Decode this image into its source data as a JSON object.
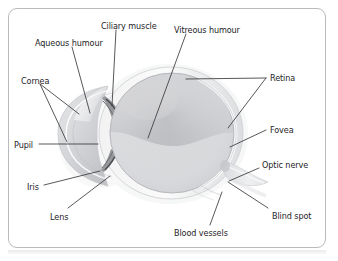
{
  "figure": {
    "frame_border_color": "#b9babc",
    "background_color": "#ffffff",
    "label_text_color": "#1d1d1f",
    "leader_line_color": "#3a3a3c"
  },
  "labels": [
    {
      "id": "ciliary-muscle",
      "text": "Ciliary muscle",
      "x": 101,
      "y": 22
    },
    {
      "id": "vitreous-humour",
      "text": "Vitreous humour",
      "x": 174,
      "y": 26
    },
    {
      "id": "aqueous-humour",
      "text": "Aqueous humour",
      "x": 35,
      "y": 39
    },
    {
      "id": "cornea",
      "text": "Cornea",
      "x": 21,
      "y": 77
    },
    {
      "id": "retina",
      "text": "Retina",
      "x": 270,
      "y": 74
    },
    {
      "id": "fovea",
      "text": "Fovea",
      "x": 270,
      "y": 126
    },
    {
      "id": "pupil",
      "text": "Pupil",
      "x": 14,
      "y": 141
    },
    {
      "id": "optic-nerve",
      "text": "Optic nerve",
      "x": 262,
      "y": 161
    },
    {
      "id": "iris",
      "text": "Iris",
      "x": 27,
      "y": 183
    },
    {
      "id": "lens",
      "text": "Lens",
      "x": 50,
      "y": 213
    },
    {
      "id": "blood-vessels",
      "text": "Blood vessels",
      "x": 174,
      "y": 229
    },
    {
      "id": "blind-spot",
      "text": "Blind spot",
      "x": 272,
      "y": 212
    }
  ],
  "anatomy_parts": [
    {
      "id": "sclera",
      "name": "Sclera outer coat"
    },
    {
      "id": "cornea-dome",
      "name": "Cornea"
    },
    {
      "id": "anterior-chamber",
      "name": "Aqueous humour chamber"
    },
    {
      "id": "lens-body",
      "name": "Lens"
    },
    {
      "id": "iris-upper",
      "name": "Iris upper leaf"
    },
    {
      "id": "iris-lower",
      "name": "Iris lower leaf"
    },
    {
      "id": "ciliary-body",
      "name": "Ciliary muscle"
    },
    {
      "id": "vitreous-body",
      "name": "Vitreous humour"
    },
    {
      "id": "retina-layer",
      "name": "Retina"
    },
    {
      "id": "optic-nerve-stalk",
      "name": "Optic nerve"
    }
  ]
}
